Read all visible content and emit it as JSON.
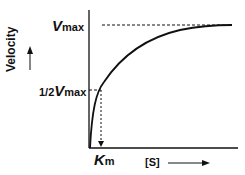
{
  "diagram": {
    "y_axis_label": "Velocity",
    "x_axis_label": "[S]",
    "vmax_label": {
      "prefix": "V",
      "sub": "max"
    },
    "half_vmax_label": {
      "prefix": "1/2",
      "var": "V",
      "sub": "max"
    },
    "km_label": {
      "prefix": "K",
      "sub": "m"
    },
    "colors": {
      "line": "#111111",
      "background": "#ffffff"
    }
  }
}
